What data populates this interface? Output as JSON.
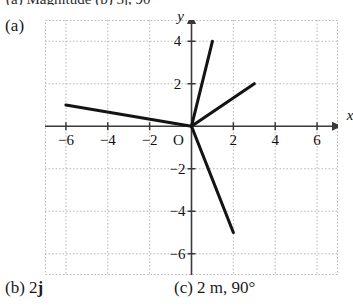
{
  "clipped_header": {
    "left_fragment": "(a) Magnitude (b) 5j, 90°",
    "right_fragment": ""
  },
  "part_a": {
    "label": "(a)"
  },
  "chart_data": {
    "type": "scatter",
    "title": "",
    "xlabel": "x",
    "ylabel": "y",
    "xlim": [
      -7,
      7
    ],
    "ylim": [
      -7,
      5
    ],
    "grid": true,
    "grid_step": 2,
    "legend": "none",
    "x_tick_labels": [
      "−6",
      "−4",
      "−2",
      "2",
      "4",
      "6"
    ],
    "x_tick_values": [
      -6,
      -4,
      -2,
      2,
      4,
      6
    ],
    "y_tick_labels": [
      "4",
      "2",
      "−2",
      "−4",
      "−6"
    ],
    "y_tick_values": [
      4,
      2,
      -2,
      -4,
      -6
    ],
    "origin_label": "O",
    "vectors": [
      {
        "name": "vector-1",
        "from": [
          0,
          0
        ],
        "to": [
          -6,
          1
        ]
      },
      {
        "name": "vector-2",
        "from": [
          0,
          0
        ],
        "to": [
          1,
          4
        ]
      },
      {
        "name": "vector-3",
        "from": [
          0,
          0
        ],
        "to": [
          3,
          2
        ]
      },
      {
        "name": "vector-4",
        "from": [
          0,
          0
        ],
        "to": [
          2,
          -5
        ]
      }
    ]
  },
  "answers": {
    "b_prefix": "(b) 2",
    "b_unit": "j",
    "c": "(c) 2 m, 90°"
  },
  "colors": {
    "ink": "#1a1a1a",
    "grid": "#b9b9b9",
    "axis": "#3a3a3a",
    "vector": "#141414",
    "background": "#ffffff"
  }
}
